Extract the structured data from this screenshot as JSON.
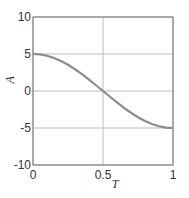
{
  "chart_data": {
    "type": "line",
    "title": "",
    "xlabel": "T",
    "ylabel": "A",
    "xlim": [
      0,
      1
    ],
    "ylim": [
      -10,
      10
    ],
    "xticks": [
      0,
      0.5,
      1
    ],
    "xtick_labels": [
      "0",
      "0.5",
      "1"
    ],
    "yticks": [
      -10,
      -5,
      0,
      5,
      10
    ],
    "ytick_labels": [
      "-10",
      "-5",
      "0",
      "5",
      "10"
    ],
    "grid": true,
    "series": [
      {
        "name": "A(T) = 5 cos(pi T)",
        "color": "#8c8c8c",
        "x": [
          0,
          0.05,
          0.1,
          0.15,
          0.2,
          0.25,
          0.3,
          0.35,
          0.4,
          0.45,
          0.5,
          0.55,
          0.6,
          0.65,
          0.7,
          0.75,
          0.8,
          0.85,
          0.9,
          0.95,
          1
        ],
        "y": [
          5,
          4.94,
          4.76,
          4.46,
          4.05,
          3.54,
          2.94,
          2.27,
          1.55,
          0.78,
          0,
          -0.78,
          -1.55,
          -2.27,
          -2.94,
          -3.54,
          -4.05,
          -4.46,
          -4.76,
          -4.94,
          -5
        ]
      }
    ]
  }
}
